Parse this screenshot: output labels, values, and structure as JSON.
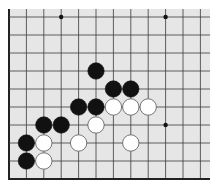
{
  "board": {
    "description": "Go board corner diagram (lower-left corner)",
    "background": "#e6e6e6",
    "line_color": "#3a3a3a",
    "edge_color": "#222222",
    "origin_x": 9,
    "origin_y": 17,
    "spacing_x": 17.4,
    "spacing_y": 18,
    "columns": 12,
    "rows": 10,
    "board_left": 9,
    "board_top": 9,
    "board_right": 210,
    "board_bottom": 179,
    "left_edge": true,
    "bottom_edge": true
  },
  "star_points": [
    {
      "col": 3,
      "row": 0
    },
    {
      "col": 9,
      "row": 0
    },
    {
      "col": 9,
      "row": 6
    }
  ],
  "stones": [
    {
      "color": "black",
      "col": 5,
      "row": 3
    },
    {
      "color": "black",
      "col": 6,
      "row": 4
    },
    {
      "color": "black",
      "col": 7,
      "row": 4
    },
    {
      "color": "black",
      "col": 4,
      "row": 5
    },
    {
      "color": "black",
      "col": 5,
      "row": 5
    },
    {
      "color": "white",
      "col": 6,
      "row": 5
    },
    {
      "color": "white",
      "col": 7,
      "row": 5
    },
    {
      "color": "white",
      "col": 8,
      "row": 5
    },
    {
      "color": "black",
      "col": 2,
      "row": 6
    },
    {
      "color": "black",
      "col": 3,
      "row": 6
    },
    {
      "color": "white",
      "col": 5,
      "row": 6
    },
    {
      "color": "black",
      "col": 1,
      "row": 7
    },
    {
      "color": "white",
      "col": 2,
      "row": 7
    },
    {
      "color": "white",
      "col": 4,
      "row": 7
    },
    {
      "color": "white",
      "col": 7,
      "row": 7
    },
    {
      "color": "black",
      "col": 1,
      "row": 8
    },
    {
      "color": "white",
      "col": 2,
      "row": 8
    }
  ]
}
